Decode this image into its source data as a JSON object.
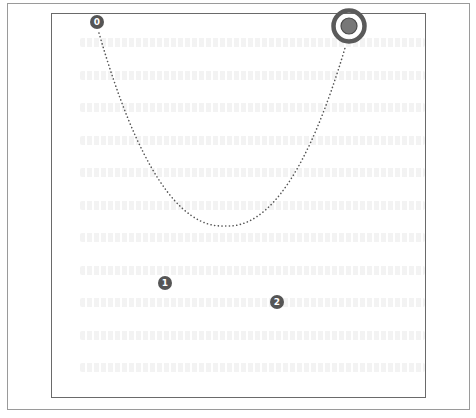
{
  "figure": {
    "frame": {
      "x": 7,
      "y": 3,
      "width": 463,
      "height": 407,
      "color": "#9a9a9a"
    },
    "panel": {
      "x": 51,
      "y": 13,
      "width": 375,
      "height": 385,
      "color": "#6a6a6a"
    },
    "trajectory": {
      "style": "dotted",
      "color": "#555555",
      "start": {
        "x": 99,
        "y": 33
      },
      "vertex": {
        "x": 225,
        "y": 226
      },
      "end": {
        "x": 345,
        "y": 48
      }
    },
    "markers": [
      {
        "label": "0",
        "x": 97,
        "y": 22,
        "color": "#555555"
      },
      {
        "label": "1",
        "x": 165,
        "y": 283,
        "color": "#555555"
      },
      {
        "label": "2",
        "x": 277,
        "y": 302,
        "color": "#555555"
      }
    ],
    "target": {
      "x": 349,
      "y": 26,
      "outer_ring_color": "#5a5a5a",
      "inner_fill_color": "#777777"
    },
    "bleed_lines_y": [
      42,
      75,
      107,
      140,
      172,
      205,
      237,
      270,
      302,
      335,
      367
    ]
  }
}
